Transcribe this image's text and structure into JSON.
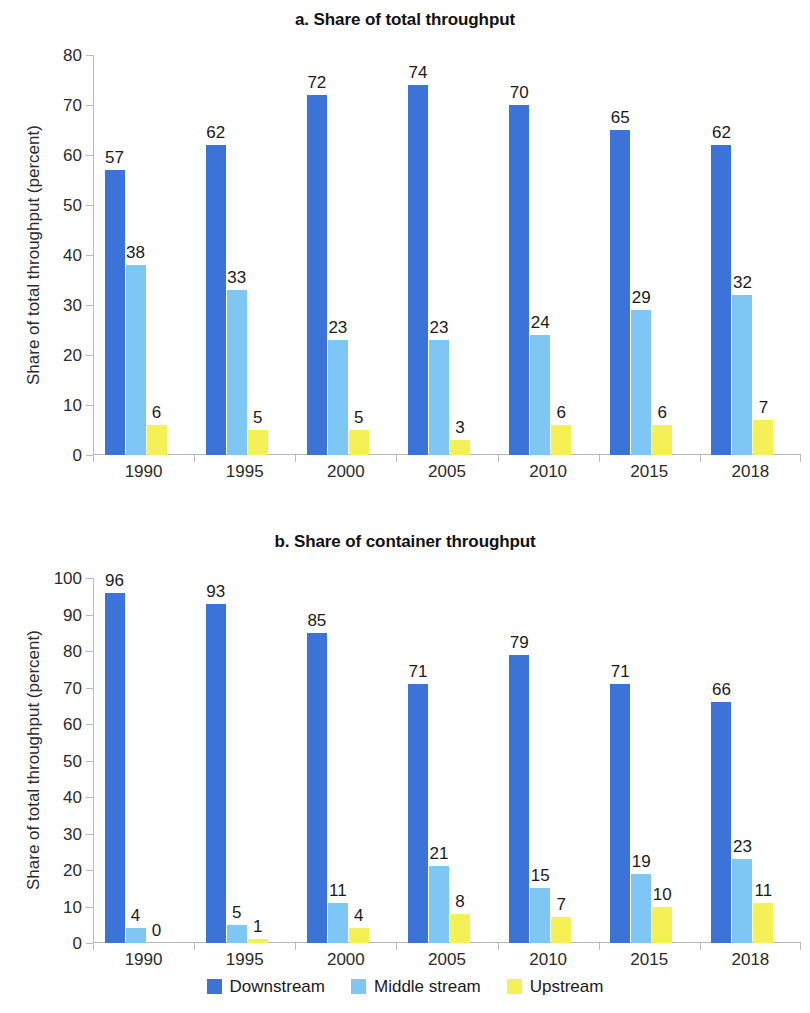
{
  "colors": {
    "downstream": "#3b74d6",
    "middle": "#7ec6f4",
    "upstream": "#f4f056",
    "axis": "#b9b9b9",
    "text": "#1a1a1a"
  },
  "legend": {
    "items": [
      {
        "label": "Downstream",
        "color": "#3b74d6"
      },
      {
        "label": "Middle stream",
        "color": "#7ec6f4"
      },
      {
        "label": "Upstream",
        "color": "#f4f056"
      }
    ]
  },
  "chart_data": [
    {
      "type": "bar",
      "title": "a. Share of total throughput",
      "xlabel": "",
      "ylabel": "Share of total throughput (percent)",
      "categories": [
        "1990",
        "1995",
        "2000",
        "2005",
        "2010",
        "2015",
        "2018"
      ],
      "series": [
        {
          "name": "Downstream",
          "color": "#3b74d6",
          "values": [
            57,
            62,
            72,
            74,
            70,
            65,
            62
          ]
        },
        {
          "name": "Middle stream",
          "color": "#7ec6f4",
          "values": [
            38,
            33,
            23,
            23,
            24,
            29,
            32
          ]
        },
        {
          "name": "Upstream",
          "color": "#f4f056",
          "values": [
            6,
            5,
            5,
            3,
            6,
            6,
            7
          ]
        }
      ],
      "ylim": [
        0,
        80
      ],
      "yticks": [
        0,
        10,
        20,
        30,
        40,
        50,
        60,
        70,
        80
      ],
      "grid": false,
      "legend_position": "bottom"
    },
    {
      "type": "bar",
      "title": "b. Share of container throughput",
      "xlabel": "",
      "ylabel": "Share of total throughput (percent)",
      "categories": [
        "1990",
        "1995",
        "2000",
        "2005",
        "2010",
        "2015",
        "2018"
      ],
      "series": [
        {
          "name": "Downstream",
          "color": "#3b74d6",
          "values": [
            96,
            93,
            85,
            71,
            79,
            71,
            66
          ]
        },
        {
          "name": "Middle stream",
          "color": "#7ec6f4",
          "values": [
            4,
            5,
            11,
            21,
            15,
            19,
            23
          ]
        },
        {
          "name": "Upstream",
          "color": "#f4f056",
          "values": [
            0,
            1,
            4,
            8,
            7,
            10,
            11
          ]
        }
      ],
      "ylim": [
        0,
        100
      ],
      "yticks": [
        0,
        10,
        20,
        30,
        40,
        50,
        60,
        70,
        80,
        90,
        100
      ],
      "grid": false,
      "legend_position": "bottom"
    }
  ]
}
